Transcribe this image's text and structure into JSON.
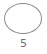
{
  "option": {
    "label": "5",
    "shape": "circle-outline",
    "selected": false,
    "colors": {
      "border": "#8a8a8a",
      "fill": "#ffffff",
      "label": "#6f6f6f"
    }
  }
}
